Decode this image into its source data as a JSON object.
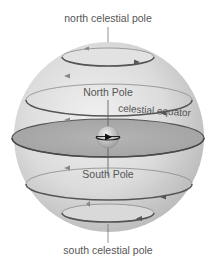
{
  "diagram": {
    "labels": {
      "north_celestial_pole": "north celestial pole",
      "north_pole": "North Pole",
      "celestial_equator": "celestial equator",
      "south_pole": "South Pole",
      "south_celestial_pole": "south celestial pole"
    },
    "colors": {
      "sphere_light": "#e6e6e6",
      "sphere_dark": "#b8b8b8",
      "equator_plane": "#a9a9a9",
      "orbit_line_back": "#8a8a8a",
      "orbit_line_front": "#555555",
      "text": "#555555"
    }
  }
}
